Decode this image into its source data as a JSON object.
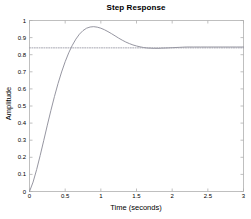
{
  "chart_data": {
    "type": "line",
    "title": "Step Response",
    "xlabel": "Time (seconds)",
    "ylabel": "Amplitude",
    "xlim": [
      0,
      3
    ],
    "ylim": [
      0,
      1
    ],
    "grid": false,
    "legend": null,
    "xticks": [
      "0",
      "0.5",
      "1",
      "1.5",
      "2",
      "2.5",
      "3"
    ],
    "xtick_values": [
      0,
      0.5,
      1,
      1.5,
      2,
      2.5,
      3
    ],
    "yticks": [
      "0",
      "0.1",
      "0.2",
      "0.3",
      "0.4",
      "0.5",
      "0.6",
      "0.7",
      "0.8",
      "0.9",
      "1"
    ],
    "ytick_values": [
      0,
      0.1,
      0.2,
      0.3,
      0.4,
      0.5,
      0.6,
      0.7,
      0.8,
      0.9,
      1
    ],
    "series": [
      {
        "name": "step-response",
        "color": "#8a8a96",
        "style": "solid",
        "x": [
          0,
          0.05,
          0.1,
          0.15,
          0.2,
          0.25,
          0.3,
          0.35,
          0.4,
          0.45,
          0.5,
          0.55,
          0.6,
          0.65,
          0.7,
          0.75,
          0.8,
          0.85,
          0.9,
          0.95,
          1.0,
          1.05,
          1.1,
          1.15,
          1.2,
          1.25,
          1.3,
          1.35,
          1.4,
          1.45,
          1.5,
          1.55,
          1.6,
          1.65,
          1.7,
          1.75,
          1.8,
          1.85,
          1.9,
          1.95,
          2.0,
          2.1,
          2.2,
          2.3,
          2.4,
          2.5,
          2.6,
          2.7,
          2.8,
          2.9,
          3.0
        ],
        "y": [
          0.0,
          0.055,
          0.128,
          0.211,
          0.299,
          0.388,
          0.474,
          0.556,
          0.631,
          0.699,
          0.759,
          0.811,
          0.855,
          0.891,
          0.92,
          0.941,
          0.955,
          0.962,
          0.964,
          0.961,
          0.955,
          0.946,
          0.935,
          0.923,
          0.91,
          0.897,
          0.885,
          0.874,
          0.865,
          0.857,
          0.851,
          0.846,
          0.842,
          0.839,
          0.838,
          0.837,
          0.837,
          0.838,
          0.839,
          0.84,
          0.841,
          0.843,
          0.845,
          0.845,
          0.845,
          0.845,
          0.845,
          0.845,
          0.845,
          0.845,
          0.845
        ]
      },
      {
        "name": "reference-line",
        "color": "#9a9aa6",
        "style": "dotted",
        "x": [
          0,
          3
        ],
        "y": [
          0.84,
          0.84
        ]
      }
    ],
    "annotations": {
      "peak_value": 0.964,
      "peak_time": 0.9,
      "steady_state": 0.845,
      "reference_level": 0.84
    }
  },
  "axes": {
    "frame_color": "#b0b0b0",
    "text_color": "#000000",
    "background": "#ffffff"
  }
}
